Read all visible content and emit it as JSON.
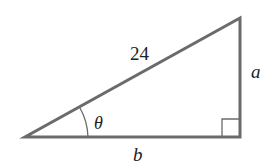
{
  "diagram": {
    "type": "right-triangle",
    "labels": {
      "hypotenuse": "24",
      "opposite": "a",
      "adjacent": "b",
      "angle": "θ"
    },
    "colors": {
      "stroke": "#6b6b6b",
      "text": "#222222"
    }
  }
}
